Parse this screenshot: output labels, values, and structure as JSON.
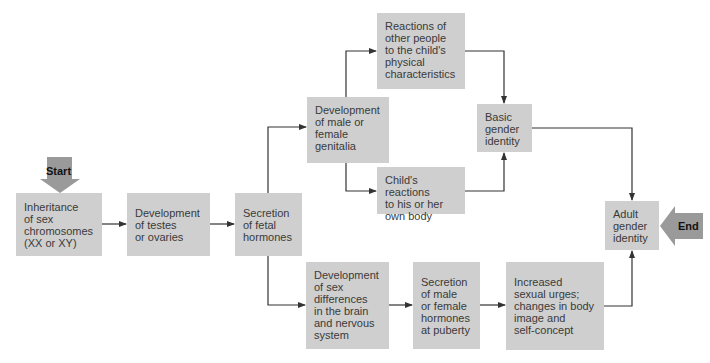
{
  "diagram": {
    "start_label": "Start",
    "end_label": "End",
    "colors": {
      "box_fill": "#cfcfcf",
      "marker_fill": "#9a9a9a",
      "line": "#333333",
      "text": "#3a3a3a"
    },
    "nodes": {
      "inheritance": "Inheritance\nof sex\nchromosomes\n(XX or XY)",
      "testes": "Development\nof testes\nor ovaries",
      "fetal_hormones": "Secretion\nof  fetal\nhormones",
      "genitalia": "Development\nof male or\nfemale\ngenitalia",
      "reactions_others": "Reactions of\nother people\nto the child's\nphysical\ncharacteristics",
      "basic_identity": "Basic\ngender\nidentity",
      "child_reactions": "Child's reactions\nto his or her\nown body",
      "brain_differences": "Development\nof sex\ndifferences\nin the brain\nand nervous\nsystem",
      "puberty_hormones": "Secretion\nof male\nor female\nhormones\nat puberty",
      "sexual_urges": "Increased\nsexual urges;\nchanges in body\nimage and\nself-concept",
      "adult_identity": "Adult\ngender\nidentity"
    },
    "edges": [
      [
        "inheritance",
        "testes"
      ],
      [
        "testes",
        "fetal_hormones"
      ],
      [
        "fetal_hormones",
        "genitalia"
      ],
      [
        "fetal_hormones",
        "brain_differences"
      ],
      [
        "genitalia",
        "reactions_others"
      ],
      [
        "genitalia",
        "child_reactions"
      ],
      [
        "reactions_others",
        "basic_identity"
      ],
      [
        "child_reactions",
        "basic_identity"
      ],
      [
        "basic_identity",
        "adult_identity"
      ],
      [
        "brain_differences",
        "puberty_hormones"
      ],
      [
        "puberty_hormones",
        "sexual_urges"
      ],
      [
        "sexual_urges",
        "adult_identity"
      ]
    ]
  }
}
